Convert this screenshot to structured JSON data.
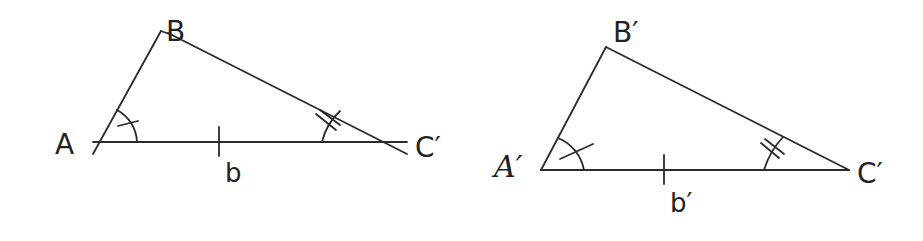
{
  "figure": {
    "type": "similar-triangles-ASA",
    "left_triangle": {
      "vertices": {
        "A": "A",
        "B": "B",
        "C": "C′"
      },
      "side_label": "b",
      "marks": {
        "angle_A": "single-arc-single-tick",
        "angle_C": "single-arc-double-tick",
        "side_b": "single-tick"
      }
    },
    "right_triangle": {
      "vertices": {
        "A": "A′",
        "B": "B′",
        "C": "C′"
      },
      "side_label": "b′",
      "marks": {
        "angle_A": "single-arc-single-tick",
        "angle_C": "single-arc-double-tick",
        "side_b": "single-tick"
      }
    }
  },
  "colors": {
    "stroke": "#2a2a2a",
    "background": "#ffffff"
  }
}
